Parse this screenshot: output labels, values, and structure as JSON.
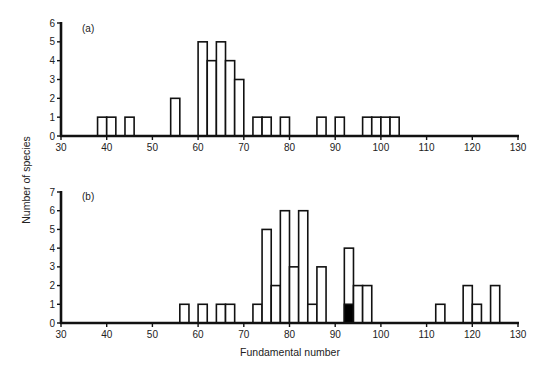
{
  "figure": {
    "ylabel": "Number of species",
    "xlabel": "Fundamental number",
    "colors": {
      "ink": "#111111",
      "background": "#ffffff",
      "filled_bar": "#000000"
    }
  },
  "chart_data": [
    {
      "type": "bar",
      "panel": "(a)",
      "title": "(a)",
      "xlabel": "",
      "ylabel": "Number of species",
      "xlim": [
        30,
        130
      ],
      "ylim": [
        0,
        6
      ],
      "x_ticks": [
        30,
        40,
        50,
        60,
        70,
        80,
        90,
        100,
        110,
        120,
        130
      ],
      "y_ticks": [
        0,
        1,
        2,
        3,
        4,
        5,
        6
      ],
      "bin_width": 2,
      "grid": false,
      "bins": [
        {
          "start": 38,
          "end": 40,
          "value": 1
        },
        {
          "start": 40,
          "end": 42,
          "value": 1
        },
        {
          "start": 44,
          "end": 46,
          "value": 1
        },
        {
          "start": 54,
          "end": 56,
          "value": 2
        },
        {
          "start": 60,
          "end": 62,
          "value": 5
        },
        {
          "start": 62,
          "end": 64,
          "value": 4
        },
        {
          "start": 64,
          "end": 66,
          "value": 5
        },
        {
          "start": 66,
          "end": 68,
          "value": 4
        },
        {
          "start": 68,
          "end": 70,
          "value": 3
        },
        {
          "start": 72,
          "end": 74,
          "value": 1
        },
        {
          "start": 74,
          "end": 76,
          "value": 1
        },
        {
          "start": 78,
          "end": 80,
          "value": 1
        },
        {
          "start": 86,
          "end": 88,
          "value": 1
        },
        {
          "start": 90,
          "end": 92,
          "value": 1
        },
        {
          "start": 96,
          "end": 98,
          "value": 1
        },
        {
          "start": 98,
          "end": 100,
          "value": 1
        },
        {
          "start": 100,
          "end": 102,
          "value": 1
        },
        {
          "start": 102,
          "end": 104,
          "value": 1
        }
      ]
    },
    {
      "type": "bar",
      "panel": "(b)",
      "title": "(b)",
      "xlabel": "Fundamental number",
      "ylabel": "Number of species",
      "xlim": [
        30,
        130
      ],
      "ylim": [
        0,
        7
      ],
      "x_ticks": [
        30,
        40,
        50,
        60,
        70,
        80,
        90,
        100,
        110,
        120,
        130
      ],
      "y_ticks": [
        0,
        1,
        2,
        3,
        4,
        5,
        6,
        7
      ],
      "bin_width": 2,
      "grid": false,
      "bins": [
        {
          "start": 56,
          "end": 58,
          "value": 1,
          "filled": 0
        },
        {
          "start": 60,
          "end": 62,
          "value": 1,
          "filled": 0
        },
        {
          "start": 64,
          "end": 66,
          "value": 1,
          "filled": 0
        },
        {
          "start": 66,
          "end": 68,
          "value": 1,
          "filled": 0
        },
        {
          "start": 72,
          "end": 74,
          "value": 1,
          "filled": 0
        },
        {
          "start": 74,
          "end": 76,
          "value": 5,
          "filled": 0
        },
        {
          "start": 76,
          "end": 78,
          "value": 2,
          "filled": 0
        },
        {
          "start": 78,
          "end": 80,
          "value": 6,
          "filled": 0
        },
        {
          "start": 80,
          "end": 82,
          "value": 3,
          "filled": 0
        },
        {
          "start": 82,
          "end": 84,
          "value": 6,
          "filled": 0
        },
        {
          "start": 84,
          "end": 86,
          "value": 1,
          "filled": 0
        },
        {
          "start": 86,
          "end": 88,
          "value": 3,
          "filled": 0
        },
        {
          "start": 92,
          "end": 94,
          "value": 4,
          "filled": 1
        },
        {
          "start": 94,
          "end": 96,
          "value": 2,
          "filled": 0
        },
        {
          "start": 96,
          "end": 98,
          "value": 2,
          "filled": 0
        },
        {
          "start": 112,
          "end": 114,
          "value": 1,
          "filled": 0
        },
        {
          "start": 118,
          "end": 120,
          "value": 2,
          "filled": 0
        },
        {
          "start": 120,
          "end": 122,
          "value": 1,
          "filled": 0
        },
        {
          "start": 124,
          "end": 126,
          "value": 2,
          "filled": 0
        }
      ]
    }
  ],
  "layout": {
    "x_px": {
      "min_val": 30,
      "min_px": 61,
      "max_val": 130,
      "max_px": 518
    },
    "panels": [
      {
        "y0_px": 136,
        "ytop_px": 23,
        "ytop_val": 6,
        "label_x": 82,
        "label_y": 32
      },
      {
        "y0_px": 323,
        "ytop_px": 192,
        "ytop_val": 7,
        "label_x": 82,
        "label_y": 200
      }
    ],
    "ylabel_pos": {
      "x": 30,
      "y": 180
    },
    "xlabel_pos": {
      "x": 290,
      "y": 356
    }
  }
}
